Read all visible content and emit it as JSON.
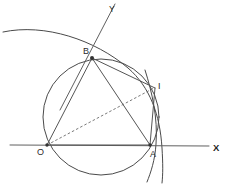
{
  "figure": {
    "background_color": "#ffffff",
    "ink_color": "#4a4a4a",
    "width": 226,
    "height": 184
  },
  "axes": {
    "x_axis": {
      "label": "X",
      "label_x": 213,
      "label_y": 151,
      "from_x": 10,
      "from_y": 145,
      "to_x": 209,
      "to_y": 146
    },
    "y_axis": {
      "label": "Y",
      "label_x": 109,
      "label_y": 12,
      "from_x": 115,
      "from_y": 4,
      "to_x": 60,
      "to_y": 110
    }
  },
  "points": [
    {
      "name": "O",
      "x": 47,
      "y": 145,
      "label_x": 37,
      "label_y": 155,
      "dot": true
    },
    {
      "name": "A",
      "x": 150,
      "y": 145,
      "label_x": 150,
      "label_y": 157,
      "dot": true
    },
    {
      "name": "B",
      "x": 92,
      "y": 58,
      "label_x": 83,
      "label_y": 54,
      "dot": true
    },
    {
      "name": "I",
      "x": 155,
      "y": 88,
      "label_x": 158,
      "label_y": 89,
      "dot": false
    }
  ],
  "circle": {
    "name": "circumscribed-circle",
    "center_x": 101,
    "center_y": 117,
    "radius": 58
  },
  "arcs": [
    {
      "name": "large-arc-through-B-and-I",
      "path": "M 3 32 C 45 23 95 40 128 68 C 150 87 160 115 162 148 C 163 164 163 174 162 183"
    },
    {
      "name": "small-arc-near-A",
      "path": "M 145 70 C 152 92 158 118 156 144 C 155 160 151 172 147 182"
    }
  ],
  "chords": [
    {
      "name": "segment-O-B",
      "x1": 47,
      "y1": 145,
      "x2": 92,
      "y2": 58
    },
    {
      "name": "segment-O-A",
      "x1": 47,
      "y1": 145,
      "x2": 150,
      "y2": 145
    },
    {
      "name": "segment-B-A",
      "x1": 92,
      "y1": 58,
      "x2": 150,
      "y2": 145
    },
    {
      "name": "segment-B-I",
      "x1": 92,
      "y1": 58,
      "x2": 155,
      "y2": 88
    },
    {
      "name": "segment-I-A",
      "x1": 155,
      "y1": 88,
      "x2": 150,
      "y2": 145
    }
  ],
  "dashed_lines": [
    {
      "name": "dashed-segment-O-I",
      "x1": 47,
      "y1": 145,
      "x2": 154,
      "y2": 88
    }
  ],
  "chart_data": {
    "type": "scatter",
    "xlabel": "X",
    "ylabel": "Y",
    "categories": [
      "O",
      "A",
      "B",
      "I"
    ],
    "x": [
      47,
      150,
      92,
      155
    ],
    "y": [
      145,
      145,
      58,
      88
    ],
    "grid": false,
    "legend": "none",
    "annotations": [
      "Circle centered at (101,117) with radius 58 passes through O, A, B and I",
      "Triangle O-B-A inscribed in the circle",
      "Dashed segment from O to I",
      "Y axis is an oblique line passing through B",
      "X axis is horizontal through O and A"
    ]
  }
}
